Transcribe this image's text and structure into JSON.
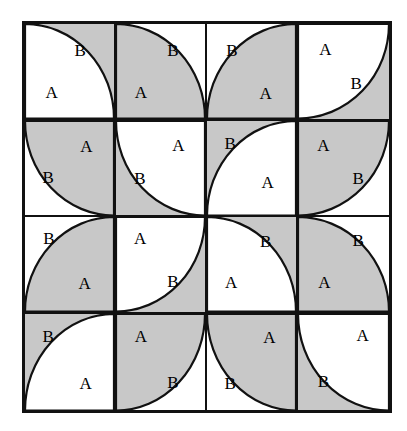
{
  "figure": {
    "name": "quarter-circle-tiling-grid",
    "rows": 4,
    "cols": 4,
    "colors": {
      "shaded": "#c8c8c8",
      "unshaded": "#ffffff",
      "line": "#111111",
      "text": "#000000"
    },
    "labels": {
      "shaded_label": "A",
      "unshaded_label": "B"
    },
    "cells": [
      {
        "id": "r1c1",
        "row": 1,
        "col": 1,
        "background": "shaded",
        "arc_corner": "bottom-left",
        "arc_fill": "unshaded",
        "arc_label": "A",
        "arc_label_x": 30,
        "arc_label_y": 72,
        "field_label": "B",
        "field_label_x": 62,
        "field_label_y": 27
      },
      {
        "id": "r1c2",
        "row": 1,
        "col": 2,
        "background": "unshaded",
        "arc_corner": "bottom-left",
        "arc_fill": "shaded",
        "arc_label": "A",
        "arc_label_x": 28,
        "arc_label_y": 72,
        "field_label": "B",
        "field_label_x": 64,
        "field_label_y": 28
      },
      {
        "id": "r1c3",
        "row": 1,
        "col": 3,
        "background": "unshaded",
        "arc_corner": "bottom-right",
        "arc_fill": "shaded",
        "arc_label": "A",
        "arc_label_x": 66,
        "arc_label_y": 73,
        "field_label": "B",
        "field_label_x": 28,
        "field_label_y": 27
      },
      {
        "id": "r1c4",
        "row": 1,
        "col": 4,
        "background": "shaded",
        "arc_corner": "top-left",
        "arc_fill": "unshaded",
        "arc_label": "A",
        "arc_label_x": 30,
        "arc_label_y": 26,
        "field_label": "B",
        "field_label_x": 64,
        "field_label_y": 62
      },
      {
        "id": "r2c1",
        "row": 2,
        "col": 1,
        "background": "unshaded",
        "arc_corner": "top-right",
        "arc_fill": "shaded",
        "arc_label": "A",
        "arc_label_x": 69,
        "arc_label_y": 27,
        "field_label": "B",
        "field_label_x": 26,
        "field_label_y": 60
      },
      {
        "id": "r2c2",
        "row": 2,
        "col": 2,
        "background": "shaded",
        "arc_corner": "top-right",
        "arc_fill": "unshaded",
        "arc_label": "A",
        "arc_label_x": 70,
        "arc_label_y": 26,
        "field_label": "B",
        "field_label_x": 27,
        "field_label_y": 61
      },
      {
        "id": "r2c3",
        "row": 2,
        "col": 3,
        "background": "shaded",
        "arc_corner": "bottom-right",
        "arc_fill": "unshaded",
        "arc_label": "A",
        "arc_label_x": 68,
        "arc_label_y": 65,
        "field_label": "B",
        "field_label_x": 26,
        "field_label_y": 24
      },
      {
        "id": "r2c4",
        "row": 2,
        "col": 4,
        "background": "unshaded",
        "arc_corner": "top-left",
        "arc_fill": "shaded",
        "arc_label": "A",
        "arc_label_x": 28,
        "arc_label_y": 26,
        "field_label": "B",
        "field_label_x": 66,
        "field_label_y": 61
      },
      {
        "id": "r3c1",
        "row": 3,
        "col": 1,
        "background": "unshaded",
        "arc_corner": "bottom-right",
        "arc_fill": "shaded",
        "arc_label": "A",
        "arc_label_x": 67,
        "arc_label_y": 70,
        "field_label": "B",
        "field_label_x": 27,
        "field_label_y": 22
      },
      {
        "id": "r3c2",
        "row": 3,
        "col": 2,
        "background": "shaded",
        "arc_corner": "top-left",
        "arc_fill": "unshaded",
        "arc_label": "A",
        "arc_label_x": 27,
        "arc_label_y": 22,
        "field_label": "B",
        "field_label_x": 64,
        "field_label_y": 68
      },
      {
        "id": "r3c3",
        "row": 3,
        "col": 3,
        "background": "shaded",
        "arc_corner": "bottom-left",
        "arc_fill": "unshaded",
        "arc_label": "A",
        "arc_label_x": 27,
        "arc_label_y": 69,
        "field_label": "B",
        "field_label_x": 66,
        "field_label_y": 25
      },
      {
        "id": "r3c4",
        "row": 3,
        "col": 4,
        "background": "unshaded",
        "arc_corner": "bottom-left",
        "arc_fill": "shaded",
        "arc_label": "A",
        "arc_label_x": 29,
        "arc_label_y": 69,
        "field_label": "B",
        "field_label_x": 66,
        "field_label_y": 24
      },
      {
        "id": "r4c1",
        "row": 4,
        "col": 1,
        "background": "shaded",
        "arc_corner": "bottom-right",
        "arc_fill": "unshaded",
        "arc_label": "A",
        "arc_label_x": 68,
        "arc_label_y": 72,
        "field_label": "B",
        "field_label_x": 26,
        "field_label_y": 23
      },
      {
        "id": "r4c2",
        "row": 4,
        "col": 2,
        "background": "unshaded",
        "arc_corner": "top-left",
        "arc_fill": "shaded",
        "arc_label": "A",
        "arc_label_x": 28,
        "arc_label_y": 23,
        "field_label": "B",
        "field_label_x": 64,
        "field_label_y": 71
      },
      {
        "id": "r4c3",
        "row": 4,
        "col": 3,
        "background": "unshaded",
        "arc_corner": "top-right",
        "arc_fill": "shaded",
        "arc_label": "A",
        "arc_label_x": 70,
        "arc_label_y": 24,
        "field_label": "B",
        "field_label_x": 26,
        "field_label_y": 72
      },
      {
        "id": "r4c4",
        "row": 4,
        "col": 4,
        "background": "shaded",
        "arc_corner": "top-right",
        "arc_fill": "unshaded",
        "arc_label": "A",
        "arc_label_x": 71,
        "arc_label_y": 22,
        "field_label": "B",
        "field_label_x": 28,
        "field_label_y": 70
      }
    ]
  }
}
